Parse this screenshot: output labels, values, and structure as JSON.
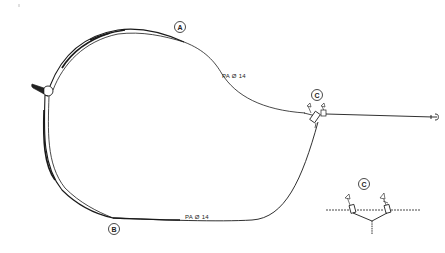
{
  "diagram": {
    "type": "technical line drawing",
    "labels": {
      "point_a": "A",
      "point_b": "B",
      "point_c": "C",
      "inset_c": "C"
    },
    "annotations": {
      "upper_line": "PA Ø 14",
      "lower_line": "PA Ø 14"
    },
    "elements": [
      "left-buoy-junction",
      "upper-rope-arc",
      "lower-rope-arc",
      "c-float-junction",
      "anchor-line",
      "anchor",
      "inset-detail-c"
    ],
    "colors": {
      "ink": "#1a1a1a",
      "background": "#ffffff"
    }
  }
}
